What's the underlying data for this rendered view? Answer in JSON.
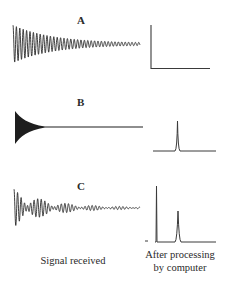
{
  "panels": [
    {
      "id": "A",
      "label": "A",
      "signal": "decaying sinusoid (slow decay)",
      "spectrum": "single peak at zero frequency"
    },
    {
      "id": "B",
      "label": "B",
      "signal": "rapidly decaying high-frequency oscillation",
      "spectrum": "single sharp peak"
    },
    {
      "id": "C",
      "label": "C",
      "signal": "sum of two decaying oscillations (beat pattern)",
      "spectrum": "two peaks: tall at left, smaller at right"
    }
  ],
  "captions": {
    "left": "Signal received",
    "right_line1": "After processing",
    "right_line2": "by computer"
  },
  "colors": {
    "ink": "#2a2a2a",
    "background": "#ffffff"
  }
}
